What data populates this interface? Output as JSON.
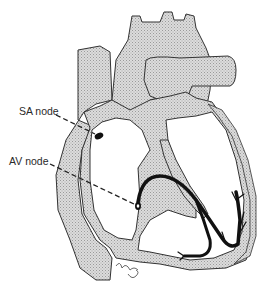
{
  "diagram": {
    "labels": {
      "sa_node": "SA node",
      "av_node": "AV node"
    },
    "colors": {
      "background": "#ffffff",
      "tissue_fill": "#d4d4d4",
      "outline": "#333333",
      "conduction_path": "#111111",
      "leader_line": "#222222"
    }
  }
}
